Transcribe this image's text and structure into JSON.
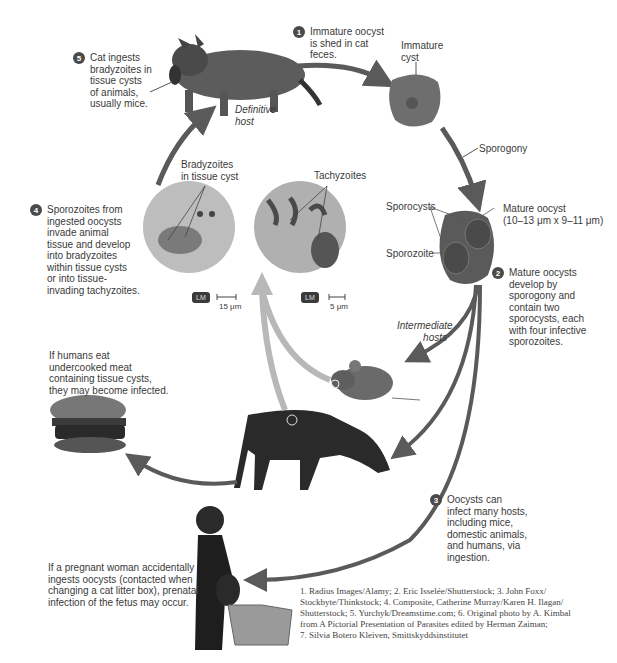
{
  "steps": [
    {
      "num": "1",
      "text": "Immature oocyst is shed in cat feces.",
      "lines": [
        "Immature oocyst",
        "is shed in cat",
        "feces."
      ]
    },
    {
      "num": "2",
      "lines": [
        "Mature oocysts",
        "develop by",
        "sporogony and",
        "contain two",
        "sporocysts, each",
        "with four infective",
        "sporozoites."
      ]
    },
    {
      "num": "3",
      "lines": [
        "Oocysts can",
        "infect many hosts,",
        "including mice,",
        "domestic animals,",
        "and humans, via",
        "ingestion."
      ]
    },
    {
      "num": "4",
      "lines": [
        "Sporozoites from",
        "ingested oocysts",
        "invade animal",
        "tissue and develop",
        "into bradyzoites",
        "within tissue cysts",
        "or into tissue-",
        "invading tachyzoites."
      ]
    },
    {
      "num": "5",
      "lines": [
        "Cat ingests",
        "bradyzoites in",
        "tissue cysts",
        "of animals,",
        "usually mice."
      ]
    }
  ],
  "labels": {
    "definitive_host": [
      "Definitive",
      "host"
    ],
    "immature_cyst": [
      "Immature",
      "cyst"
    ],
    "sporogony": "Sporogony",
    "sporocysts": "Sporocysts",
    "mature_oocyst": [
      "Mature oocyst",
      "(10–13 μm x 9–11 μm)"
    ],
    "sporozoite": "Sporozoite",
    "intermediate_hosts": [
      "Intermediate",
      "hosts"
    ],
    "bradyzoites": [
      "Bradyzoites",
      "in tissue cyst"
    ],
    "tachyzoites": "Tachyzoites",
    "lm_badge_1": "LM",
    "lm_badge_2": "LM",
    "scale_1": "15 μm",
    "scale_2": "5 μm"
  },
  "notes": {
    "humans_meat": [
      "If humans eat",
      "undercooked meat",
      "containing tissue cysts,",
      "they may become infected."
    ],
    "pregnant": [
      "If a pregnant woman accidentally",
      "ingests oocysts (contacted when",
      "changing a cat litter box), prenatal",
      "infection of the fetus may occur."
    ]
  },
  "credits": [
    "1. Radius Images/Alamy; 2. Eric Isselée/Shutterstock; 3. John Foxx/",
    "Stockbyte/Thinkstock; 4. Composite, Catherine Murray/Karen H. Ilagan/",
    "Shutterstock; 5. Yurchyk/Dreamstime.com; 6. Original photo by A. Kimbal",
    "from A Pictorial Presentation of Parasites edited by Herman Zaiman;",
    "7. Silvia Botero Kleiven, Smittskyddsinstitutet"
  ],
  "images": {
    "cat": "cat-with-mouse",
    "immature_cyst": "immature-oocyst",
    "mature_oocyst": "mature-oocyst",
    "bradyzoite_micrograph": "bradyzoite-micrograph",
    "tachyzoite_micrograph": "tachyzoite-micrograph",
    "mouse": "mouse",
    "cow": "cow",
    "burger": "hamburger",
    "pregnant_woman": "pregnant-woman-litter-box"
  },
  "colors": {
    "arrow": "#5a5a5a",
    "arrow_light": "#b8b8b8",
    "badge": "#4a4a4a",
    "text": "#3a3a3a"
  }
}
